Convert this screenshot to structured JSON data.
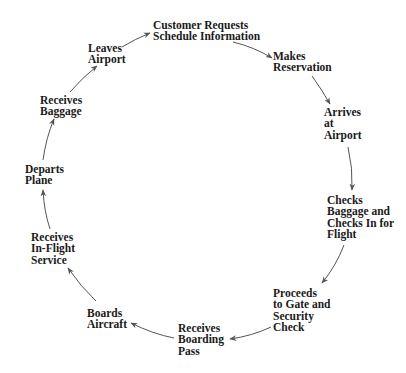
{
  "diagram": {
    "type": "cycle",
    "title": "",
    "arrow_color": "#555555",
    "text_color": "#1a1a1a",
    "nodes": [
      {
        "id": "customer-requests",
        "lines": [
          "Customer Requests",
          "Schedule Information"
        ]
      },
      {
        "id": "makes-reservation",
        "lines": [
          "Makes",
          "Reservation"
        ]
      },
      {
        "id": "arrives-at-airport",
        "lines": [
          "Arrives",
          "at",
          "Airport"
        ]
      },
      {
        "id": "checks-baggage",
        "lines": [
          "Checks",
          "Baggage and",
          "Checks In for",
          "Flight"
        ]
      },
      {
        "id": "proceeds-to-gate",
        "lines": [
          "Proceeds",
          "to Gate and",
          "Security",
          "Check"
        ]
      },
      {
        "id": "receives-boarding-pass",
        "lines": [
          "Receives",
          "Boarding",
          "Pass"
        ]
      },
      {
        "id": "boards-aircraft",
        "lines": [
          "Boards",
          "Aircraft"
        ]
      },
      {
        "id": "receives-in-flight-service",
        "lines": [
          "Receives",
          "In-Flight",
          "Service"
        ]
      },
      {
        "id": "departs-plane",
        "lines": [
          "Departs",
          "Plane"
        ]
      },
      {
        "id": "receives-baggage",
        "lines": [
          "Receives",
          "Baggage"
        ]
      },
      {
        "id": "leaves-airport",
        "lines": [
          "Leaves",
          "Airport"
        ]
      }
    ],
    "edges": [
      {
        "from": "customer-requests",
        "to": "makes-reservation"
      },
      {
        "from": "makes-reservation",
        "to": "arrives-at-airport"
      },
      {
        "from": "arrives-at-airport",
        "to": "checks-baggage"
      },
      {
        "from": "checks-baggage",
        "to": "proceeds-to-gate"
      },
      {
        "from": "proceeds-to-gate",
        "to": "receives-boarding-pass"
      },
      {
        "from": "receives-boarding-pass",
        "to": "boards-aircraft"
      },
      {
        "from": "boards-aircraft",
        "to": "receives-in-flight-service"
      },
      {
        "from": "receives-in-flight-service",
        "to": "departs-plane"
      },
      {
        "from": "departs-plane",
        "to": "receives-baggage"
      },
      {
        "from": "receives-baggage",
        "to": "leaves-airport"
      },
      {
        "from": "leaves-airport",
        "to": "customer-requests"
      }
    ]
  }
}
